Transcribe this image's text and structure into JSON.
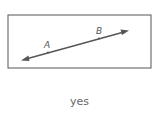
{
  "figure": {
    "type": "line-through-two-points",
    "points": [
      {
        "label": "A",
        "x": 48,
        "y": 52
      },
      {
        "label": "B",
        "x": 99,
        "y": 38
      }
    ],
    "line_color": "#555555",
    "box_color": "#555555"
  },
  "answer": {
    "text": "yes"
  }
}
